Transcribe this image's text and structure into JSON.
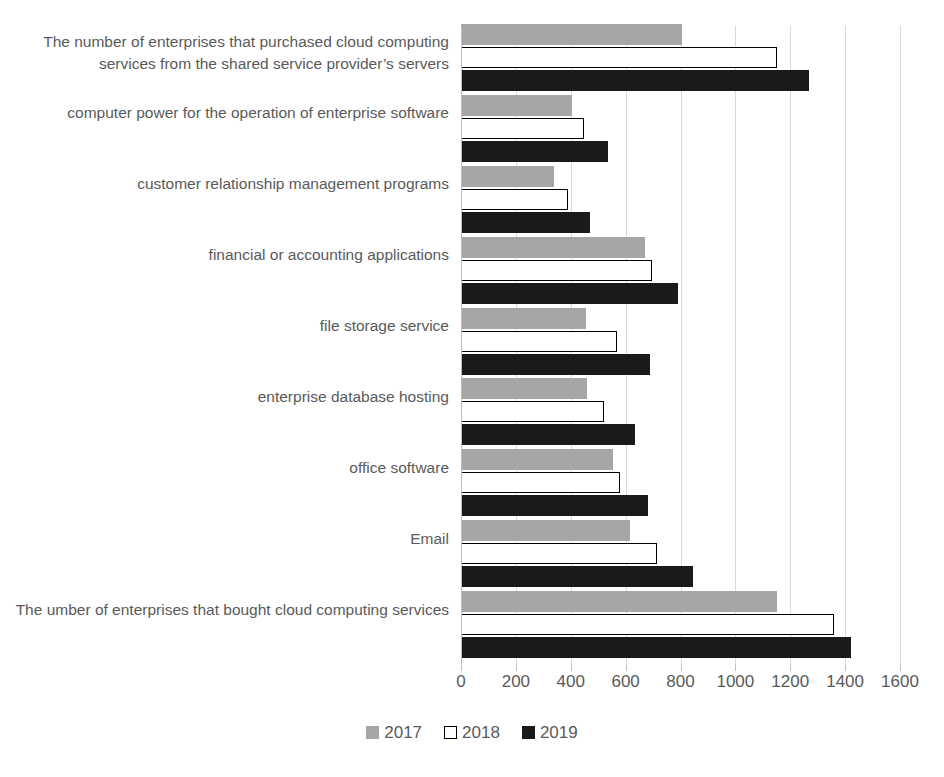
{
  "chart_data": {
    "type": "bar",
    "orientation": "horizontal",
    "title": "",
    "xlabel": "",
    "ylabel": "",
    "xlim": [
      0,
      1600
    ],
    "xticks": [
      0,
      200,
      400,
      600,
      800,
      1000,
      1200,
      1400,
      1600
    ],
    "xtick_labels": [
      "0",
      "200",
      "400",
      "600",
      "800",
      "1000",
      "1200",
      "1400",
      "1600"
    ],
    "grid": true,
    "legend_position": "bottom",
    "categories": [
      "The number of enterprises that purchased cloud computing services from the shared service provider’s servers",
      "computer power for the operation of enterprise software",
      "customer relationship management programs",
      "financial or accounting applications",
      "file storage service",
      "enterprise database hosting",
      "office software",
      "Email",
      "The umber of enterprises that bought cloud computing services"
    ],
    "series": [
      {
        "name": "2017",
        "color": "#a6a6a6",
        "values": [
          805,
          405,
          340,
          670,
          455,
          460,
          555,
          615,
          1150
        ]
      },
      {
        "name": "2018",
        "color": "#ffffff",
        "edge_color": "#000000",
        "values": [
          1150,
          450,
          390,
          695,
          570,
          520,
          580,
          715,
          1360
        ]
      },
      {
        "name": "2019",
        "color": "#1a1a1a",
        "values": [
          1270,
          535,
          470,
          790,
          690,
          635,
          680,
          845,
          1420
        ]
      }
    ]
  },
  "legend": {
    "items": [
      {
        "label": "2017",
        "swatch": "y2017"
      },
      {
        "label": "2018",
        "swatch": "y2018"
      },
      {
        "label": "2019",
        "swatch": "y2019"
      }
    ]
  },
  "colors": {
    "series_2017": "#a6a6a6",
    "series_2018": "#ffffff",
    "series_2019": "#1a1a1a",
    "gridline": "#d9d9d9",
    "text": "#595959"
  }
}
